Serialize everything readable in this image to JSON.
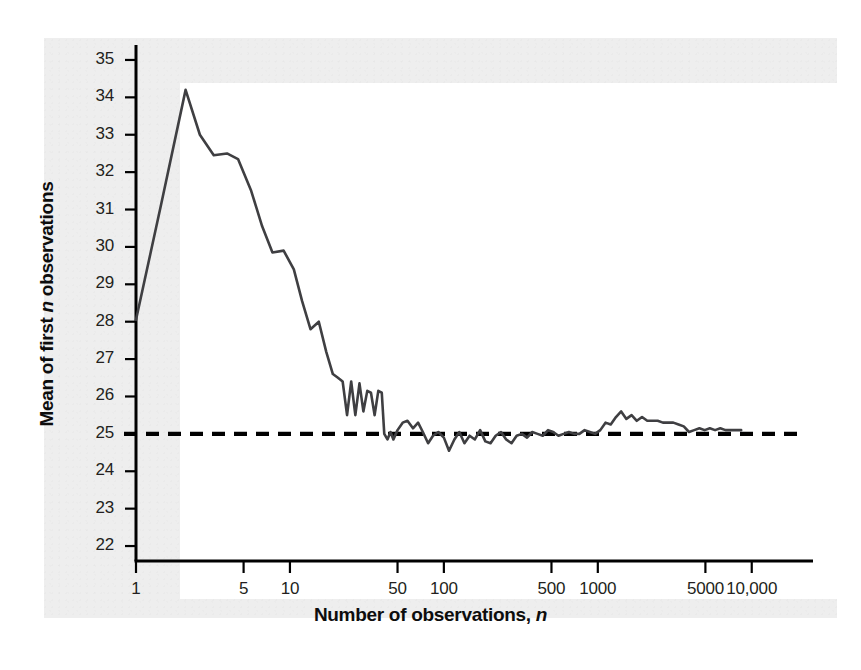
{
  "figure": {
    "background_color": "#eeeeee",
    "panel_color": "#ffffff",
    "line_color": "#3f3f42",
    "reference_color": "#000000",
    "axis_color": "#000000"
  },
  "axis_titles": {
    "x_prefix": "Number of observations, ",
    "x_italic": "n",
    "y_prefix": "Mean of first ",
    "y_italic": "n",
    "y_suffix": " observations"
  },
  "chart_data": {
    "type": "line",
    "title": "",
    "xlabel": "Number of observations, n",
    "ylabel": "Mean of first n observations",
    "xscale": "log",
    "xlim": [
      1,
      25000
    ],
    "ylim": [
      21.6,
      35.4
    ],
    "grid": false,
    "legend": "none",
    "y_ticks": [
      35,
      34,
      33,
      32,
      31,
      30,
      29,
      28,
      27,
      26,
      25,
      24,
      23,
      22
    ],
    "x_ticks": [
      1,
      5,
      10,
      50,
      100,
      500,
      1000,
      5000,
      10000
    ],
    "x_tick_labels": [
      "1",
      "5",
      "10",
      "50",
      "100",
      "500",
      "1000",
      "5000",
      "10,000"
    ],
    "reference_line": {
      "orientation": "horizontal",
      "value": 25,
      "style": "dashed",
      "label": "population mean = 25"
    },
    "series": [
      {
        "name": "Running mean of first n observations",
        "style": "solid",
        "x": [
          1,
          1.45,
          2.1,
          2.6,
          3.2,
          3.9,
          4.6,
          5.6,
          6.6,
          7.7,
          9.1,
          10.6,
          12.0,
          13.6,
          15.4,
          17.2,
          19.0,
          20.5,
          22.0,
          23.5,
          25.0,
          26.6,
          28.3,
          30.0,
          31.8,
          33.6,
          35.5,
          37.5,
          39.5,
          41.0,
          43.0,
          45.0,
          47.0,
          50.0,
          54.0,
          58.0,
          63.0,
          68.0,
          73.0,
          79.0,
          85.0,
          92.0,
          100.0,
          108.0,
          117.0,
          126.0,
          136.0,
          147.0,
          159.0,
          172.0,
          186.0,
          201.0,
          217.0,
          235.0,
          254.0,
          275.0,
          297.0,
          321.0,
          347.0,
          375.0,
          406.0,
          439.0,
          475.0,
          513.0,
          555.0,
          600.0,
          649.0,
          702.0,
          759.0,
          821.0,
          888.0,
          960.0,
          1038.0,
          1122.0,
          1213.0,
          1312.0,
          1418.0,
          1533.0,
          1658.0,
          1792.0,
          1938.0,
          2095.0,
          2265.0,
          2449.0,
          2648.0,
          2863.0,
          3095.0,
          3346.0,
          3618.0,
          3912.0,
          4229.0,
          4573.0,
          4944.0,
          5345.0,
          5779.0,
          6248.0,
          6755.0,
          7303.0,
          7896.0,
          8537.0
        ],
        "y": [
          28.05,
          31.1,
          34.2,
          33.0,
          32.45,
          32.5,
          32.35,
          31.5,
          30.55,
          29.85,
          29.9,
          29.4,
          28.55,
          27.8,
          28.0,
          27.2,
          26.6,
          26.5,
          26.4,
          25.5,
          26.4,
          25.5,
          26.35,
          25.6,
          26.15,
          26.1,
          25.5,
          26.15,
          26.1,
          25.0,
          24.85,
          25.05,
          24.85,
          25.1,
          25.3,
          25.35,
          25.15,
          25.3,
          25.05,
          24.75,
          24.95,
          25.05,
          24.9,
          24.55,
          24.85,
          25.05,
          24.75,
          24.95,
          24.85,
          25.1,
          24.8,
          24.75,
          24.95,
          25.05,
          24.85,
          24.75,
          24.95,
          25.0,
          24.9,
          25.05,
          25.0,
          24.95,
          25.1,
          25.05,
          24.95,
          25.0,
          25.05,
          25.0,
          25.0,
          25.1,
          25.05,
          25.0,
          25.1,
          25.3,
          25.25,
          25.45,
          25.6,
          25.4,
          25.5,
          25.35,
          25.45,
          25.35,
          25.35,
          25.35,
          25.3,
          25.3,
          25.3,
          25.25,
          25.2,
          25.05,
          25.1,
          25.15,
          25.1,
          25.15,
          25.1,
          25.15,
          25.1,
          25.1,
          25.1,
          25.1
        ]
      }
    ]
  }
}
